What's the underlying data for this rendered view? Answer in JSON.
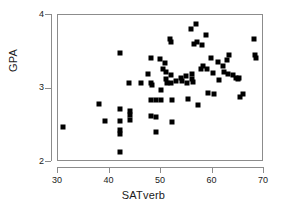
{
  "chart_data": {
    "type": "scatter",
    "title": "",
    "xlabel": "SATverb",
    "ylabel": "GPA",
    "xlim": [
      30,
      70
    ],
    "ylim": [
      2,
      4
    ],
    "xticks": [
      30,
      40,
      50,
      60,
      70
    ],
    "yticks": [
      2,
      3,
      4
    ],
    "grid": false,
    "legend": null,
    "marker": {
      "shape": "square",
      "color": "#000000",
      "size_px": 5
    },
    "n_points": 76,
    "points": [
      [
        31.0,
        2.47
      ],
      [
        38.0,
        2.79
      ],
      [
        39.2,
        2.56
      ],
      [
        42.0,
        3.48
      ],
      [
        42.0,
        2.72
      ],
      [
        42.0,
        2.56
      ],
      [
        42.0,
        2.43
      ],
      [
        42.0,
        2.38
      ],
      [
        42.1,
        2.13
      ],
      [
        43.8,
        3.08
      ],
      [
        44.0,
        2.7
      ],
      [
        44.0,
        2.64
      ],
      [
        44.0,
        2.57
      ],
      [
        46.2,
        3.08
      ],
      [
        47.5,
        3.2
      ],
      [
        48.0,
        3.41
      ],
      [
        48.0,
        3.08
      ],
      [
        48.0,
        2.85
      ],
      [
        48.0,
        2.62
      ],
      [
        48.2,
        3.05
      ],
      [
        49.0,
        2.85
      ],
      [
        49.0,
        2.61
      ],
      [
        49.1,
        2.41
      ],
      [
        49.8,
        3.4
      ],
      [
        50.0,
        2.98
      ],
      [
        50.0,
        2.85
      ],
      [
        50.4,
        3.26
      ],
      [
        50.8,
        3.35
      ],
      [
        51.0,
        3.22
      ],
      [
        51.0,
        3.13
      ],
      [
        51.2,
        3.08
      ],
      [
        51.8,
        3.67
      ],
      [
        52.0,
        3.63
      ],
      [
        52.0,
        3.19
      ],
      [
        52.0,
        3.08
      ],
      [
        52.1,
        2.85
      ],
      [
        52.2,
        2.55
      ],
      [
        53.8,
        3.14
      ],
      [
        54.8,
        3.17
      ],
      [
        55.0,
        3.08
      ],
      [
        55.2,
        2.86
      ],
      [
        55.8,
        3.81
      ],
      [
        56.0,
        3.2
      ],
      [
        56.0,
        3.13
      ],
      [
        56.2,
        3.09
      ],
      [
        56.5,
        3.6
      ],
      [
        56.8,
        3.88
      ],
      [
        57.0,
        3.63
      ],
      [
        57.1,
        2.78
      ],
      [
        57.8,
        3.27
      ],
      [
        58.0,
        3.59
      ],
      [
        58.2,
        3.3
      ],
      [
        58.8,
        3.73
      ],
      [
        59.0,
        3.26
      ],
      [
        59.2,
        2.94
      ],
      [
        59.8,
        3.41
      ],
      [
        60.0,
        3.21
      ],
      [
        60.2,
        2.92
      ],
      [
        61.0,
        3.36
      ],
      [
        61.2,
        3.11
      ],
      [
        62.0,
        3.3
      ],
      [
        62.2,
        3.22
      ],
      [
        62.8,
        3.39
      ],
      [
        63.0,
        3.2
      ],
      [
        63.2,
        3.46
      ],
      [
        64.0,
        3.18
      ],
      [
        64.5,
        3.14
      ],
      [
        65.0,
        3.13
      ],
      [
        65.2,
        3.14
      ],
      [
        65.4,
        2.89
      ],
      [
        66.0,
        2.93
      ],
      [
        68.0,
        3.67
      ],
      [
        68.2,
        3.45
      ],
      [
        68.5,
        3.41
      ],
      [
        54.0,
        3.1
      ],
      [
        53.0,
        3.1
      ]
    ]
  },
  "axes": {
    "y_title": "GPA",
    "x_title": "SATverb",
    "y_tick_labels": [
      "2",
      "3",
      "4"
    ],
    "x_tick_labels": [
      "30",
      "40",
      "50",
      "60",
      "70"
    ]
  },
  "colors": {
    "marker": "#000000",
    "axis": "#8c8c8c",
    "text": "#1a1a1a",
    "background": "#ffffff"
  }
}
